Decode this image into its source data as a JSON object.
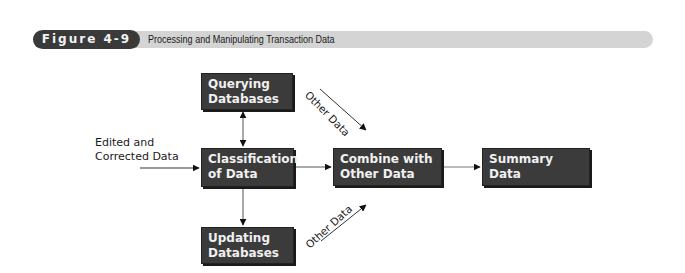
{
  "header": {
    "figure_label": "Figure 4-9",
    "title": "Processing and Manipulating Transaction Data"
  },
  "diagram": {
    "input_label": [
      "Edited and",
      "Corrected Data"
    ],
    "nodes": {
      "querying": [
        "Querying",
        "Databases"
      ],
      "classification": [
        "Classification",
        "of Data"
      ],
      "updating": [
        "Updating",
        "Databases"
      ],
      "combine": [
        "Combine with",
        "Other Data"
      ],
      "summary": [
        "Summary",
        "Data"
      ]
    },
    "edge_labels": {
      "other_data_top": "Other Data",
      "other_data_bottom": "Other Data"
    },
    "edges": [
      {
        "from": "input",
        "to": "classification"
      },
      {
        "from": "classification",
        "to": "querying",
        "bidirectional": true
      },
      {
        "from": "classification",
        "to": "updating"
      },
      {
        "from": "classification",
        "to": "combine"
      },
      {
        "from": "other_data_top",
        "to": "combine"
      },
      {
        "from": "other_data_bottom",
        "to": "combine"
      },
      {
        "from": "combine",
        "to": "summary"
      }
    ]
  }
}
